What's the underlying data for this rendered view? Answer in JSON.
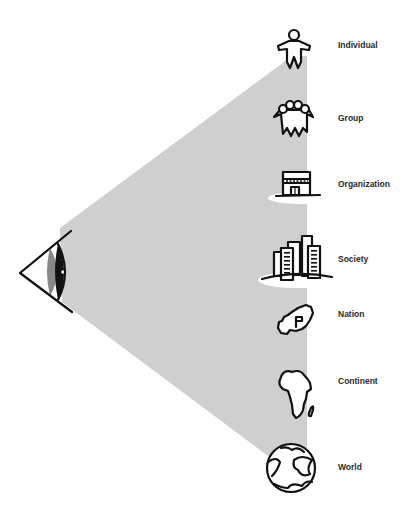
{
  "diagram": {
    "title": "",
    "viewer": {
      "icon": "eye-icon"
    },
    "cone_color": "#cfcfcf",
    "levels": [
      {
        "id": "individual",
        "label": "Individual",
        "icon": "person-icon",
        "y": 45
      },
      {
        "id": "group",
        "label": "Group",
        "icon": "group-icon",
        "y": 118
      },
      {
        "id": "organization",
        "label": "Organization",
        "icon": "building-icon",
        "y": 184
      },
      {
        "id": "society",
        "label": "Society",
        "icon": "city-icon",
        "y": 259
      },
      {
        "id": "nation",
        "label": "Nation",
        "icon": "country-map-icon",
        "y": 314
      },
      {
        "id": "continent",
        "label": "Continent",
        "icon": "africa-map-icon",
        "y": 381
      },
      {
        "id": "world",
        "label": "World",
        "icon": "globe-icon",
        "y": 467
      }
    ]
  }
}
